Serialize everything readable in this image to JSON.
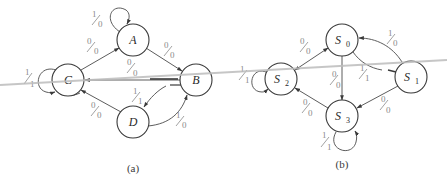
{
  "diagrams": [
    {
      "id": "a",
      "caption": "(a)",
      "states": [
        "A",
        "B",
        "C",
        "D"
      ],
      "transitions": [
        {
          "from": "A",
          "to": "A",
          "label": {
            "in": "1",
            "out": "0"
          }
        },
        {
          "from": "C",
          "to": "A",
          "label": {
            "in": "0",
            "out": "0"
          }
        },
        {
          "from": "A",
          "to": "B",
          "label": {
            "in": "0",
            "out": "0"
          }
        },
        {
          "from": "B",
          "to": "C",
          "label": {
            "in": "0",
            "out": "0"
          }
        },
        {
          "from": "C",
          "to": "C",
          "label": {
            "in": "1",
            "out": "1"
          }
        },
        {
          "from": "B",
          "to": "D",
          "label": {
            "in": "1",
            "out": "1"
          }
        },
        {
          "from": "D",
          "to": "C",
          "label": {
            "in": "0",
            "out": "0"
          }
        },
        {
          "from": "D",
          "to": "B",
          "label": {
            "in": "1",
            "out": "0"
          }
        }
      ]
    },
    {
      "id": "b",
      "caption": "(b)",
      "states": [
        "S0",
        "S1",
        "S2",
        "S3"
      ],
      "state_labels": {
        "S0": {
          "base": "S",
          "sub": "0"
        },
        "S1": {
          "base": "S",
          "sub": "1"
        },
        "S2": {
          "base": "S",
          "sub": "2"
        },
        "S3": {
          "base": "S",
          "sub": "3"
        }
      },
      "transitions": [
        {
          "from": "S2",
          "to": "S0",
          "label": {
            "in": "0",
            "out": "0"
          }
        },
        {
          "from": "S1",
          "to": "S0",
          "label": {
            "in": "1",
            "out": "0"
          }
        },
        {
          "from": "S0",
          "to": "S1",
          "label": {
            "in": "1",
            "out": "1"
          }
        },
        {
          "from": "S0",
          "to": "S3",
          "label": {
            "in": "0",
            "out": "0"
          }
        },
        {
          "from": "S2",
          "to": "S2",
          "label": {
            "in": "1",
            "out": "1"
          }
        },
        {
          "from": "S3",
          "to": "S2",
          "label": {
            "in": "0",
            "out": "0"
          }
        },
        {
          "from": "S1",
          "to": "S3",
          "label": {
            "in": "0",
            "out": "0"
          }
        },
        {
          "from": "S3",
          "to": "S3",
          "label": {
            "in": "1",
            "out": "1"
          }
        }
      ]
    }
  ]
}
